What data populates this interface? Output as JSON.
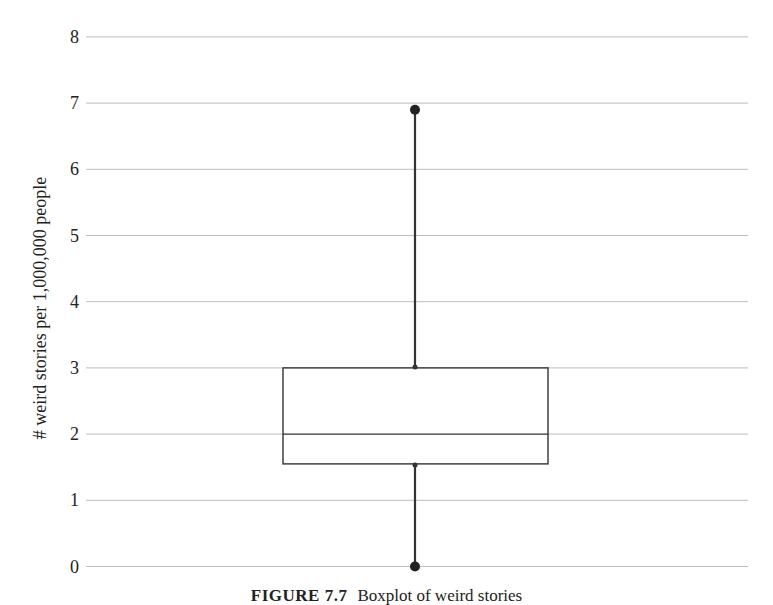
{
  "chart_data": {
    "type": "boxplot",
    "title": "",
    "xlabel": "",
    "ylabel": "# weird stories per 1,000,000 people",
    "ylim": [
      0,
      8
    ],
    "yticks": [
      0,
      1,
      2,
      3,
      4,
      5,
      6,
      7,
      8
    ],
    "grid": true,
    "legend": null,
    "series": [
      {
        "name": "weird stories",
        "min": 0,
        "q1": 1.55,
        "median": 2.0,
        "q3": 3.0,
        "max": 6.9
      }
    ]
  },
  "caption": {
    "figure_label": "FIGURE 7.7",
    "text": "Boxplot of weird stories"
  },
  "colors": {
    "grid": "#bdbdbd",
    "box_stroke": "#333333",
    "whisker": "#333333",
    "point": "#222222"
  }
}
